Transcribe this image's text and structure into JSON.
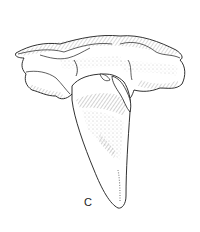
{
  "figure": {
    "style": "pen-and-ink stipple and hatching",
    "panel_label": "C",
    "colors": {
      "background": "#ffffff",
      "ink": "#1a1a1a",
      "shade": "#8a8a8a"
    }
  }
}
